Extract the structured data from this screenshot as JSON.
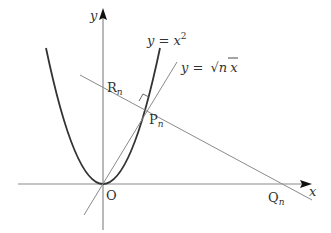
{
  "diagram": {
    "type": "coordinate-geometry",
    "axes": {
      "x_label": "x",
      "y_label": "y",
      "origin_label": "O"
    },
    "curves": {
      "parabola_label_lhs": "y = ",
      "parabola_label_base": "x",
      "parabola_label_exp": "2",
      "line_label_lhs": "y = ",
      "line_label_sqrt": "√",
      "line_label_n": "n",
      "line_label_x": "x"
    },
    "points": {
      "R": {
        "base": "R",
        "sub": "n"
      },
      "P": {
        "base": "P",
        "sub": "n"
      },
      "Q": {
        "base": "Q",
        "sub": "n"
      }
    },
    "colors": {
      "axis": "#888888",
      "parabola": "#333333",
      "line": "#888888",
      "text": "#333333"
    }
  }
}
